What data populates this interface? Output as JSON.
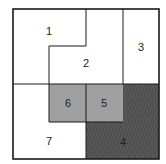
{
  "diagram": {
    "type": "region-partition",
    "colors": {
      "background": "#ffffff",
      "border": "#1a1a1a",
      "gray_fill": "#a0a0a0",
      "hatch_dark": "#4a4a4a",
      "hatch_light": "#6a6a6a"
    },
    "regions": [
      {
        "id": "1",
        "label": "1",
        "fill": "white"
      },
      {
        "id": "2",
        "label": "2",
        "fill": "white"
      },
      {
        "id": "3",
        "label": "3",
        "fill": "white"
      },
      {
        "id": "4",
        "label": "4",
        "fill": "hatched"
      },
      {
        "id": "5",
        "label": "5",
        "fill": "gray"
      },
      {
        "id": "6",
        "label": "6",
        "fill": "gray"
      },
      {
        "id": "7",
        "label": "7",
        "fill": "white"
      }
    ]
  }
}
